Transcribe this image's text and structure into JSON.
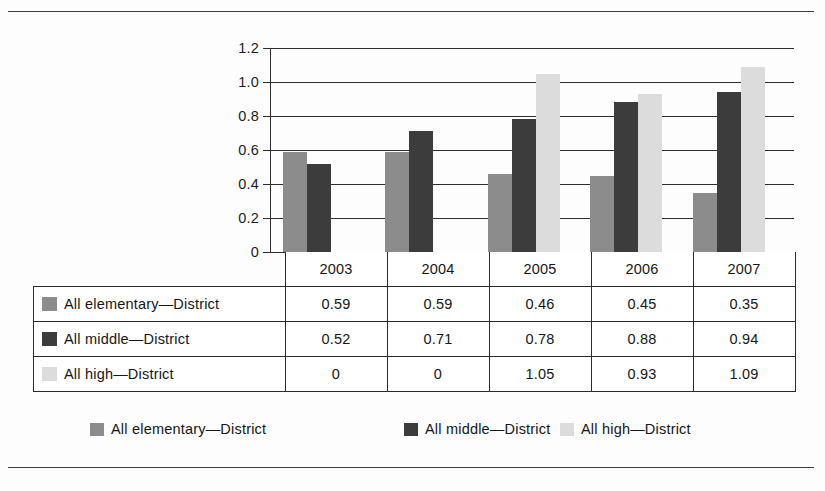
{
  "chart_data": {
    "type": "bar",
    "title": "",
    "xlabel": "",
    "ylabel": "",
    "categories": [
      "2003",
      "2004",
      "2005",
      "2006",
      "2007"
    ],
    "series": [
      {
        "name": "All elementary—District",
        "color": "#8c8c8c",
        "values": [
          0.59,
          0.59,
          0.46,
          0.45,
          0.35
        ]
      },
      {
        "name": "All middle—District",
        "color": "#3c3c3c",
        "values": [
          0.52,
          0.71,
          0.78,
          0.88,
          0.94
        ]
      },
      {
        "name": "All high—District",
        "color": "#dcdcdc",
        "values": [
          0,
          0,
          1.05,
          0.93,
          1.09
        ]
      }
    ],
    "ylim": [
      0,
      1.2
    ],
    "ytick_values": [
      0,
      0.2,
      0.4,
      0.6,
      0.8,
      1.0,
      1.2
    ],
    "ytick_labels": [
      "0",
      "0.2",
      "0.4",
      "0.6",
      "0.8",
      "1.0",
      "1.2"
    ],
    "grid": true,
    "legend_position": "bottom",
    "has_data_table": true
  },
  "data_table": {
    "corner_label": "",
    "column_headers": [
      "2003",
      "2004",
      "2005",
      "2006",
      "2007"
    ],
    "rows": [
      {
        "label": "All elementary—District",
        "swatch": "s0",
        "cells": [
          "0.59",
          "0.59",
          "0.46",
          "0.45",
          "0.35"
        ]
      },
      {
        "label": "All middle—District",
        "swatch": "s1",
        "cells": [
          "0.52",
          "0.71",
          "0.78",
          "0.88",
          "0.94"
        ]
      },
      {
        "label": "All high—District",
        "swatch": "s2",
        "cells": [
          "0",
          "0",
          "1.05",
          "0.93",
          "1.09"
        ]
      }
    ]
  },
  "legend": {
    "items": [
      {
        "label": "All elementary—District",
        "swatch": "s0",
        "x": 57
      },
      {
        "label": "All middle—District",
        "swatch": "s1",
        "x": 371
      },
      {
        "label": "All high—District",
        "swatch": "s2",
        "x": 527
      }
    ]
  }
}
